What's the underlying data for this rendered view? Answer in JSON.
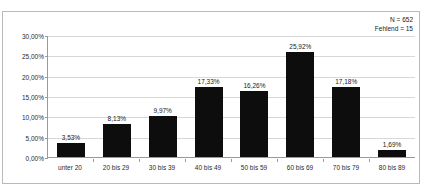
{
  "top_clipped_text": "",
  "annotation": {
    "n_label": "N = 652",
    "missing_label": "Fehlend = 15"
  },
  "chart_data": {
    "type": "bar",
    "title": "",
    "subtitle": "",
    "xlabel": "",
    "ylabel": "",
    "categories": [
      "unter 20",
      "20 bis 29",
      "30 bis 39",
      "40 bis 49",
      "50 bis 59",
      "60 bis 69",
      "70 bis 79",
      "80 bis 89"
    ],
    "values": [
      3.53,
      8.13,
      9.97,
      17.33,
      16.26,
      25.92,
      17.18,
      1.69
    ],
    "value_labels": [
      "3,53%",
      "8,13%",
      "9,97%",
      "17,33%",
      "16,26%",
      "25,92%",
      "17,18%",
      "1,69%"
    ],
    "ylim": [
      0,
      30
    ],
    "ytick_values": [
      0,
      5,
      10,
      15,
      20,
      25,
      30
    ],
    "ytick_labels": [
      "0,00%",
      "5,00%",
      "10,00%",
      "15,00%",
      "20,00%",
      "25,00%",
      "30,00%"
    ],
    "grid": true,
    "legend": "none",
    "bar_color": "#0d0d0d",
    "gridline_color": "#d8d8d8",
    "axis_color": "#9a9a9a",
    "annotations": [
      "N = 652",
      "Fehlend = 15"
    ]
  }
}
